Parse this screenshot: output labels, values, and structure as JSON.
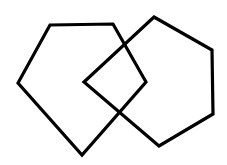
{
  "diagram": {
    "stroke_color": "#000000",
    "background": "#ffffff",
    "shapes": [
      {
        "name": "left-pentagon",
        "points": "50,25 113,24 146,82 82,155 18,83"
      },
      {
        "name": "right-pentagon",
        "points": "154,17 212,50 213,114 159,146 84,82"
      }
    ]
  }
}
